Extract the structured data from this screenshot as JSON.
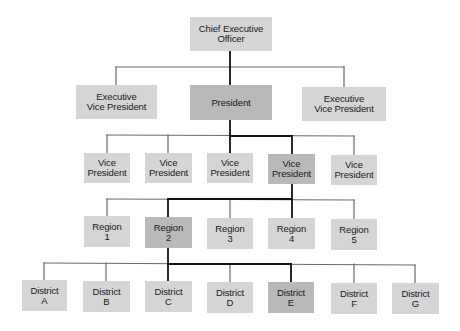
{
  "colors": {
    "box": "#d5d5d5",
    "box_highlight": "#b9b9b9",
    "line": "#6a6a6a",
    "line_highlight": "#111111",
    "text": "#1a1a1a"
  },
  "nodes": [
    {
      "id": "ceo",
      "label": "Chief Executive\nOfficer",
      "x": 190,
      "y": 17,
      "w": 82,
      "h": 34,
      "highlight": false
    },
    {
      "id": "evp1",
      "label": "Executive\nVice President",
      "x": 76,
      "y": 85,
      "w": 81,
      "h": 34,
      "highlight": false
    },
    {
      "id": "pres",
      "label": "President",
      "x": 190,
      "y": 85,
      "w": 82,
      "h": 35,
      "highlight": true
    },
    {
      "id": "evp2",
      "label": "Executive\nVice President",
      "x": 302,
      "y": 87,
      "w": 84,
      "h": 34,
      "highlight": false
    },
    {
      "id": "vp1",
      "label": "Vice\nPresident",
      "x": 84,
      "y": 153,
      "w": 46,
      "h": 30,
      "highlight": false
    },
    {
      "id": "vp2",
      "label": "Vice\nPresident",
      "x": 145,
      "y": 153,
      "w": 47,
      "h": 30,
      "highlight": false
    },
    {
      "id": "vp3",
      "label": "Vice\nPresident",
      "x": 207,
      "y": 153,
      "w": 46,
      "h": 30,
      "highlight": false
    },
    {
      "id": "vp4",
      "label": "Vice\nPresident",
      "x": 268,
      "y": 154,
      "w": 47,
      "h": 30,
      "highlight": true
    },
    {
      "id": "vp5",
      "label": "Vice\nPresident",
      "x": 331,
      "y": 155,
      "w": 46,
      "h": 30,
      "highlight": false
    },
    {
      "id": "r1",
      "label": "Region\n1",
      "x": 84,
      "y": 216,
      "w": 46,
      "h": 31,
      "highlight": false
    },
    {
      "id": "r2",
      "label": "Region\n2",
      "x": 145,
      "y": 217,
      "w": 47,
      "h": 31,
      "highlight": true
    },
    {
      "id": "r3",
      "label": "Region\n3",
      "x": 207,
      "y": 218,
      "w": 46,
      "h": 31,
      "highlight": false
    },
    {
      "id": "r4",
      "label": "Region\n4",
      "x": 268,
      "y": 218,
      "w": 47,
      "h": 31,
      "highlight": false
    },
    {
      "id": "r5",
      "label": "Region\n5",
      "x": 331,
      "y": 219,
      "w": 46,
      "h": 31,
      "highlight": false
    },
    {
      "id": "dA",
      "label": "District\nA",
      "x": 22,
      "y": 280,
      "w": 45,
      "h": 31,
      "highlight": false
    },
    {
      "id": "dB",
      "label": "District\nB",
      "x": 83,
      "y": 281,
      "w": 47,
      "h": 31,
      "highlight": false
    },
    {
      "id": "dC",
      "label": "District\nC",
      "x": 145,
      "y": 281,
      "w": 47,
      "h": 31,
      "highlight": false
    },
    {
      "id": "dD",
      "label": "District\nD",
      "x": 207,
      "y": 282,
      "w": 46,
      "h": 31,
      "highlight": false
    },
    {
      "id": "dE",
      "label": "District\nE",
      "x": 268,
      "y": 282,
      "w": 46,
      "h": 31,
      "highlight": true
    },
    {
      "id": "dF",
      "label": "District\nF",
      "x": 331,
      "y": 283,
      "w": 46,
      "h": 31,
      "highlight": false
    },
    {
      "id": "dG",
      "label": "District\nG",
      "x": 392,
      "y": 283,
      "w": 47,
      "h": 31,
      "highlight": false
    }
  ],
  "lines": [
    {
      "x1": 116,
      "y1": 67,
      "x2": 344,
      "y2": 67,
      "hl": false
    },
    {
      "x1": 116,
      "y1": 67,
      "x2": 116,
      "y2": 85,
      "hl": false
    },
    {
      "x1": 344,
      "y1": 67,
      "x2": 344,
      "y2": 87,
      "hl": false
    },
    {
      "x1": 230,
      "y1": 51,
      "x2": 230,
      "y2": 85,
      "hl": true
    },
    {
      "x1": 107,
      "y1": 135,
      "x2": 354,
      "y2": 136,
      "hl": false
    },
    {
      "x1": 107,
      "y1": 135,
      "x2": 107,
      "y2": 153,
      "hl": false
    },
    {
      "x1": 168,
      "y1": 135,
      "x2": 168,
      "y2": 153,
      "hl": false
    },
    {
      "x1": 354,
      "y1": 136,
      "x2": 354,
      "y2": 155,
      "hl": false
    },
    {
      "x1": 230,
      "y1": 120,
      "x2": 230,
      "y2": 153,
      "hl": true
    },
    {
      "x1": 230,
      "y1": 136,
      "x2": 292,
      "y2": 136,
      "hl": true
    },
    {
      "x1": 292,
      "y1": 136,
      "x2": 292,
      "y2": 154,
      "hl": true
    },
    {
      "x1": 107,
      "y1": 199,
      "x2": 354,
      "y2": 200,
      "hl": false
    },
    {
      "x1": 107,
      "y1": 199,
      "x2": 107,
      "y2": 216,
      "hl": false
    },
    {
      "x1": 230,
      "y1": 199,
      "x2": 230,
      "y2": 218,
      "hl": false
    },
    {
      "x1": 354,
      "y1": 200,
      "x2": 354,
      "y2": 219,
      "hl": false
    },
    {
      "x1": 292,
      "y1": 184,
      "x2": 292,
      "y2": 218,
      "hl": true
    },
    {
      "x1": 168,
      "y1": 199,
      "x2": 292,
      "y2": 199,
      "hl": true
    },
    {
      "x1": 168,
      "y1": 199,
      "x2": 168,
      "y2": 217,
      "hl": true
    },
    {
      "x1": 44,
      "y1": 263,
      "x2": 415,
      "y2": 265,
      "hl": false
    },
    {
      "x1": 44,
      "y1": 263,
      "x2": 44,
      "y2": 280,
      "hl": false
    },
    {
      "x1": 106,
      "y1": 263,
      "x2": 106,
      "y2": 281,
      "hl": false
    },
    {
      "x1": 230,
      "y1": 264,
      "x2": 230,
      "y2": 282,
      "hl": false
    },
    {
      "x1": 354,
      "y1": 264,
      "x2": 354,
      "y2": 283,
      "hl": false
    },
    {
      "x1": 415,
      "y1": 265,
      "x2": 415,
      "y2": 283,
      "hl": false
    },
    {
      "x1": 168,
      "y1": 248,
      "x2": 168,
      "y2": 281,
      "hl": true
    },
    {
      "x1": 168,
      "y1": 264,
      "x2": 291,
      "y2": 264,
      "hl": true
    },
    {
      "x1": 291,
      "y1": 264,
      "x2": 291,
      "y2": 282,
      "hl": true
    }
  ]
}
